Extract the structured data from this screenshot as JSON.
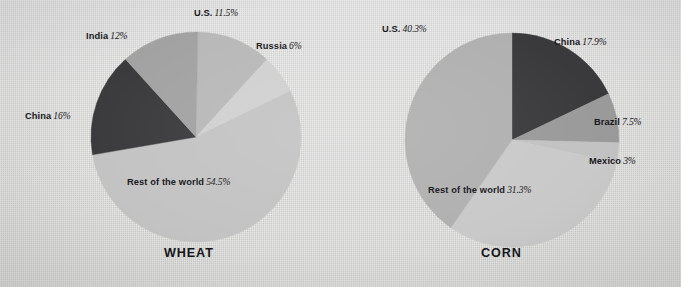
{
  "page": {
    "background_color": "#d8d8d6",
    "text_color": "#16161a"
  },
  "chart_data": [
    {
      "type": "pie",
      "title": "WHEAT",
      "id": "wheat",
      "center": [
        196,
        137
      ],
      "radius": 105,
      "start_angle_deg": 1,
      "direction": "clockwise",
      "categories": [
        "U.S.",
        "Russia",
        "Rest of the world",
        "China",
        "India"
      ],
      "values": [
        11.5,
        6,
        54.5,
        16,
        12
      ],
      "value_labels": [
        "11.5%",
        "6%",
        "54.5%",
        "16%",
        "12%"
      ],
      "colors": [
        "#b8b8b8",
        "#cfcfcf",
        "#c4c4c4",
        "#3a3a3c",
        "#a0a0a0"
      ],
      "slices": [
        {
          "name": "U.S.",
          "value": 11.5,
          "label": "11.5%",
          "color": "#b8b8b8"
        },
        {
          "name": "Russia",
          "value": 6,
          "label": "6%",
          "color": "#d0d0d0"
        },
        {
          "name": "Rest of the world",
          "value": 54.5,
          "label": "54.5%",
          "color": "#c3c3c3"
        },
        {
          "name": "China",
          "value": 16,
          "label": "16%",
          "color": "#3a3a3c"
        },
        {
          "name": "India",
          "value": 12,
          "label": "12%",
          "color": "#a2a2a2"
        }
      ],
      "legend": "labels-outside",
      "grid": false
    },
    {
      "type": "pie",
      "title": "CORN",
      "id": "corn",
      "center": [
        512,
        140
      ],
      "radius": 107,
      "start_angle_deg": 0,
      "direction": "clockwise",
      "categories": [
        "China",
        "Brazil",
        "Mexico",
        "Rest of the world",
        "U.S."
      ],
      "values": [
        17.9,
        7.5,
        3,
        31.3,
        40.3
      ],
      "value_labels": [
        "17.9%",
        "7.5%",
        "3%",
        "31.3%",
        "40.3%"
      ],
      "colors": [
        "#3a3a3c",
        "#9a9a9a",
        "#c0c0c0",
        "#c8c8c8",
        "#b0b0b0"
      ],
      "slices": [
        {
          "name": "China",
          "value": 17.9,
          "label": "17.9%",
          "color": "#3a3a3c"
        },
        {
          "name": "Brazil",
          "value": 7.5,
          "label": "7.5%",
          "color": "#9a9a9a"
        },
        {
          "name": "Mexico",
          "value": 3,
          "label": "3%",
          "color": "#c2c2c2"
        },
        {
          "name": "Rest of the world",
          "value": 31.3,
          "label": "31.3%",
          "color": "#c9c9c9"
        },
        {
          "name": "U.S.",
          "value": 40.3,
          "label": "40.3%",
          "color": "#b0b0b0"
        }
      ],
      "legend": "labels-outside",
      "grid": false
    }
  ],
  "wheat": {
    "title": "WHEAT",
    "labels": {
      "us": {
        "name": "U.S.",
        "pct": "11.5%"
      },
      "russia": {
        "name": "Russia",
        "pct": "6%"
      },
      "rest": {
        "name": "Rest of the world",
        "pct": "54.5%"
      },
      "china": {
        "name": "China",
        "pct": "16%"
      },
      "india": {
        "name": "India",
        "pct": "12%"
      }
    }
  },
  "corn": {
    "title": "CORN",
    "labels": {
      "us": {
        "name": "U.S.",
        "pct": "40.3%"
      },
      "china": {
        "name": "China",
        "pct": "17.9%"
      },
      "brazil": {
        "name": "Brazil",
        "pct": "7.5%"
      },
      "mexico": {
        "name": "Mexico",
        "pct": "3%"
      },
      "rest": {
        "name": "Rest of the world",
        "pct": "31.3%"
      }
    }
  }
}
